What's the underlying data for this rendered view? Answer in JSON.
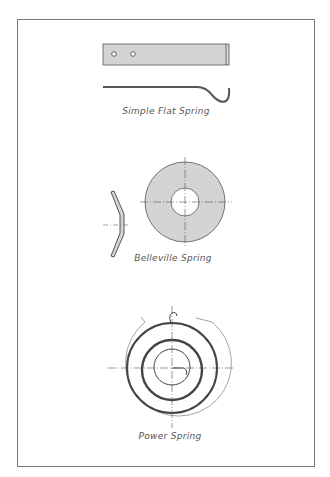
{
  "drawing": {
    "figures": [
      {
        "id": "flat",
        "caption": "Simple Flat Spring"
      },
      {
        "id": "belleville",
        "caption": "Belleville Spring"
      },
      {
        "id": "power",
        "caption": "Power Spring"
      }
    ]
  },
  "colors": {
    "fill": "#d4d4d4",
    "line": "#444444",
    "frame": "#777777"
  }
}
